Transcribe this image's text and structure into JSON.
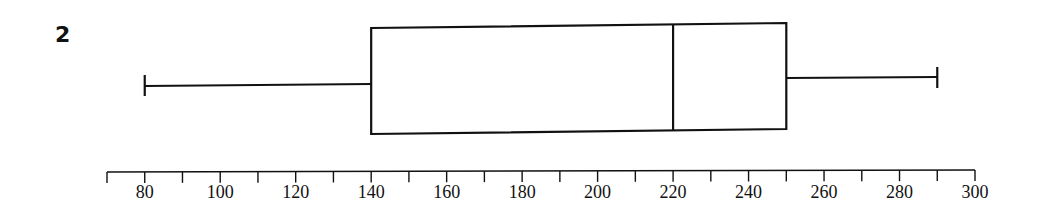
{
  "question_number": "2",
  "chart_data": {
    "type": "boxplot",
    "title": "",
    "xlabel": "",
    "ylabel": "",
    "orientation": "horizontal",
    "min": 80,
    "q1": 140,
    "median": 220,
    "q3": 250,
    "max": 290,
    "xlim": [
      70,
      300
    ],
    "major_ticks": [
      80,
      100,
      120,
      140,
      160,
      180,
      200,
      220,
      240,
      260,
      280,
      300
    ],
    "minor_tick_step": 10,
    "tick_labels": [
      "80",
      "100",
      "120",
      "140",
      "160",
      "180",
      "200",
      "220",
      "240",
      "260",
      "280",
      "300"
    ],
    "grid": false,
    "legend": null
  }
}
